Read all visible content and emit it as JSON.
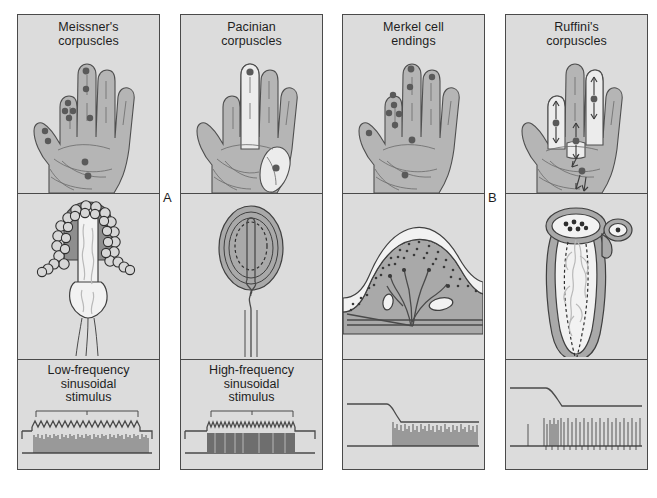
{
  "figure": {
    "group_labels": [
      {
        "id": "A",
        "label": "A",
        "meaning": "rapidly adapting receptors"
      },
      {
        "id": "B",
        "label": "B",
        "meaning": "slowly adapting receptors"
      }
    ],
    "row_names": [
      "receptive-field-hand-map",
      "receptor-morphology",
      "stimulus-and-response-trace"
    ]
  },
  "columns": [
    {
      "key": "meissner",
      "title_line1": "Meissner's",
      "title_line2": "corpuscles",
      "group": "A",
      "hand": {
        "field_type": "small-punctate",
        "receptor_dots": 10,
        "shaded_fields": [],
        "arrows": 0
      },
      "receptor": {
        "shape": "lobulated-encapsulated-corpuscle",
        "location": "dermal-papilla"
      },
      "trace": {
        "stimulus_label_line1": "Low-frequency",
        "stimulus_label_line2": "sinusoidal",
        "stimulus_label_line3": "stimulus",
        "stimulus_waveform": "sinusoid",
        "response_pattern": "dense-burst-entrained",
        "has_bracket": true
      }
    },
    {
      "key": "pacinian",
      "title_line1": "Pacinian",
      "title_line2": "corpuscles",
      "group": "A",
      "hand": {
        "field_type": "large-diffuse",
        "receptor_dots": 2,
        "shaded_fields": 2,
        "arrows": 0
      },
      "receptor": {
        "shape": "onion-lamellated-capsule",
        "location": "deep-dermis"
      },
      "trace": {
        "stimulus_label_line1": "High-frequency",
        "stimulus_label_line2": "sinusoidal",
        "stimulus_label_line3": "stimulus",
        "stimulus_waveform": "sinusoid",
        "response_pattern": "very-dense-burst",
        "has_bracket": true
      }
    },
    {
      "key": "merkel",
      "title_line1": "Merkel cell",
      "title_line2": "endings",
      "group": "B",
      "hand": {
        "field_type": "small-punctate",
        "receptor_dots": 11,
        "shaded_fields": [],
        "arrows": 0
      },
      "receptor": {
        "shape": "epidermal-ridge-with-merkel-disks",
        "location": "basal-epidermis"
      },
      "trace": {
        "stimulus_label_line1": "",
        "stimulus_label_line2": "",
        "stimulus_label_line3": "",
        "stimulus_waveform": "step-indentation",
        "response_pattern": "sustained-irregular-firing",
        "has_bracket": false
      }
    },
    {
      "key": "ruffini",
      "title_line1": "Ruffini's",
      "title_line2": "corpuscles",
      "group": "B",
      "hand": {
        "field_type": "large-oriented",
        "receptor_dots": 4,
        "shaded_fields": 3,
        "arrows": 8
      },
      "receptor": {
        "shape": "elongated-spindle-capsule",
        "location": "deep-dermis"
      },
      "trace": {
        "stimulus_label_line1": "",
        "stimulus_label_line2": "",
        "stimulus_label_line3": "",
        "stimulus_waveform": "step-indentation",
        "response_pattern": "sustained-regular-firing",
        "has_bracket": false
      }
    }
  ],
  "colors": {
    "panel_background": "#dcdcdc",
    "panel_border": "#4a4a4a",
    "skin": "#b5b5b5",
    "skin_highlight": "#ececec",
    "receptor_dot": "#5a5a5a",
    "trace_line": "#4a4a4a",
    "text": "#1e1e1e",
    "page_background": "#ffffff"
  }
}
